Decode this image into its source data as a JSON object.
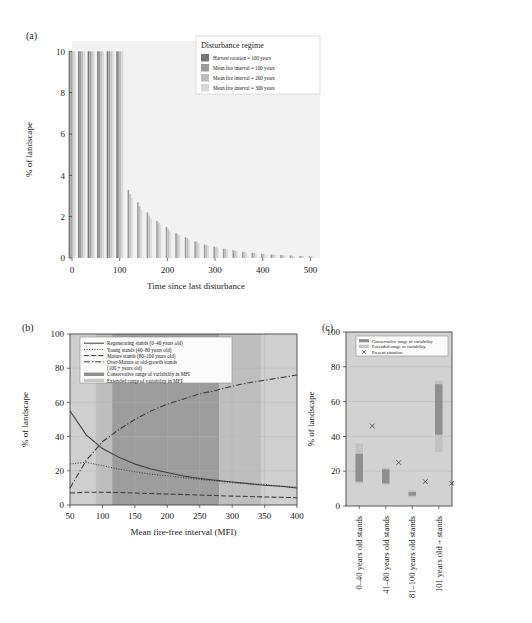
{
  "figure": {
    "panel_a_tag": "(a)",
    "panel_b_tag": "(b)",
    "panel_c_tag": "(c)"
  },
  "panel_a": {
    "ylabel": "% of landscape",
    "xlabel": "Time since last disturbance",
    "legend_title": "Disturbance regime",
    "legend": [
      {
        "label": "Harvest rotation = 100 years",
        "color": "#767676"
      },
      {
        "label": "Mean fire interval = 100 years",
        "color": "#9a9a9a"
      },
      {
        "label": "Mean fire interval = 200 years",
        "color": "#bdbdbd"
      },
      {
        "label": "Mean fire interval = 300 years",
        "color": "#d8d8d8"
      }
    ],
    "xticks": [
      "0",
      "100",
      "200",
      "300",
      "400",
      "500"
    ],
    "yticks": [
      "0",
      "2",
      "4",
      "6",
      "8",
      "10"
    ]
  },
  "panel_b": {
    "ylabel": "% of landscape",
    "xlabel": "Mean fire-free interval (MFI)",
    "xticks": [
      "50",
      "100",
      "150",
      "200",
      "250",
      "300",
      "350",
      "400"
    ],
    "yticks": [
      "0",
      "20",
      "40",
      "60",
      "80",
      "100"
    ],
    "legend": [
      {
        "label": "Regenerating stands (0–40 years old)",
        "style": "solid"
      },
      {
        "label": "Young stands (40–80 years old)",
        "style": "dotted"
      },
      {
        "label": "Mature stands (80–100 years old)",
        "style": "dashed"
      },
      {
        "label": "Over-Mature or old-growth stands",
        "style": "dashdot"
      },
      {
        "label": "(100 + years old)",
        "style": "none"
      },
      {
        "label": "Conservative range of variability in MFI",
        "style": "swatch-dark"
      },
      {
        "label": "Extended range of variability in MFI",
        "style": "swatch-light"
      }
    ]
  },
  "panel_c": {
    "ylabel": "% of landscape",
    "yticks": [
      "0",
      "20",
      "40",
      "60",
      "80",
      "100"
    ],
    "legend": [
      {
        "label": "Conservative range of variability",
        "style": "swatch-dark"
      },
      {
        "label": "Extended range of variability",
        "style": "swatch-light"
      },
      {
        "label": "Present situation",
        "style": "cross"
      }
    ],
    "categories": [
      "0–40 years old stands",
      "41–80 years old stands",
      "81–100 years old stands",
      "101 years old + stands"
    ]
  },
  "chart_data": [
    {
      "type": "bar",
      "panel": "(a)",
      "title": "",
      "xlabel": "Time since last disturbance",
      "ylabel": "% of landscape",
      "xlim": [
        0,
        520
      ],
      "ylim": [
        0,
        10.5
      ],
      "grid": false,
      "legend_title": "Disturbance regime",
      "legend_position": "upper-right-inside",
      "x": [
        0,
        20,
        40,
        60,
        80,
        100,
        120,
        140,
        160,
        180,
        200,
        220,
        240,
        260,
        280,
        300,
        320,
        340,
        360,
        380,
        400,
        420,
        440,
        460,
        480,
        500
      ],
      "series": [
        {
          "name": "Harvest rotation = 100 years",
          "color": "#767676",
          "values": [
            10,
            10,
            10,
            10,
            10,
            10,
            0,
            0,
            0,
            0,
            0,
            0,
            0,
            0,
            0,
            0,
            0,
            0,
            0,
            0,
            0,
            0,
            0,
            0,
            0,
            0
          ]
        },
        {
          "name": "Mean fire interval = 100 years",
          "color": "#9a9a9a",
          "values": [
            10,
            10,
            10,
            10,
            10,
            10,
            3.3,
            2.7,
            2.2,
            1.8,
            1.5,
            1.2,
            1.0,
            0.8,
            0.65,
            0.55,
            0.45,
            0.38,
            0.3,
            0.25,
            0.2,
            0.17,
            0.14,
            0.12,
            0.1,
            0.08
          ]
        },
        {
          "name": "Mean fire interval = 200 years",
          "color": "#bdbdbd",
          "values": [
            10,
            10,
            10,
            10,
            10,
            10,
            3.1,
            2.5,
            2.05,
            1.7,
            1.4,
            1.15,
            0.95,
            0.78,
            0.62,
            0.52,
            0.43,
            0.35,
            0.29,
            0.24,
            0.2,
            0.16,
            0.13,
            0.11,
            0.09,
            0.07
          ]
        },
        {
          "name": "Mean fire interval = 300 years",
          "color": "#d8d8d8",
          "values": [
            10,
            10,
            10,
            10,
            10,
            10,
            2.9,
            2.35,
            1.9,
            1.6,
            1.3,
            1.08,
            0.88,
            0.72,
            0.58,
            0.48,
            0.4,
            0.33,
            0.27,
            0.22,
            0.18,
            0.15,
            0.12,
            0.1,
            0.08,
            0.06
          ]
        }
      ]
    },
    {
      "type": "line",
      "panel": "(b)",
      "title": "",
      "xlabel": "Mean fire-free interval (MFI)",
      "ylabel": "% of landscape",
      "xlim": [
        50,
        400
      ],
      "ylim": [
        0,
        100
      ],
      "grid": true,
      "legend_position": "upper-left-inside",
      "x": [
        50,
        75,
        100,
        125,
        150,
        175,
        200,
        225,
        250,
        275,
        300,
        325,
        350,
        375,
        400
      ],
      "series": [
        {
          "name": "Regenerating stands (0–40 years old)",
          "style": "solid",
          "values": [
            55,
            41,
            33,
            28,
            24,
            21,
            19,
            17,
            15.5,
            14.5,
            13.5,
            12.5,
            11.5,
            11,
            10
          ]
        },
        {
          "name": "Young stands (40–80 years old)",
          "style": "dotted",
          "values": [
            24,
            25,
            23,
            21,
            19.5,
            18,
            17,
            16,
            15,
            14,
            13,
            12.5,
            12,
            11,
            10.5
          ]
        },
        {
          "name": "Mature stands (80–100 years old)",
          "style": "dashed",
          "values": [
            7,
            7.5,
            7.5,
            7.3,
            7,
            6.7,
            6.4,
            6.1,
            5.8,
            5.5,
            5.2,
            5,
            4.7,
            4.5,
            4.3
          ]
        },
        {
          "name": "Over-Mature or old-growth stands (100 + years old)",
          "style": "dashdot",
          "values": [
            10,
            26,
            37,
            44,
            50,
            55,
            59,
            62,
            65,
            67,
            69.5,
            71.5,
            73,
            74.5,
            76
          ]
        }
      ],
      "bands": [
        {
          "name": "Extended range of variability in MFI",
          "from": 50,
          "to": 90,
          "color": "#cfcfcf"
        },
        {
          "name": "Extended range of variability in MFI",
          "from": 90,
          "to": 115,
          "color": "#bebebe"
        },
        {
          "name": "Conservative range of variability in MFI",
          "from": 115,
          "to": 280,
          "color": "#9d9d9d"
        },
        {
          "name": "Extended range of variability in MFI",
          "from": 280,
          "to": 345,
          "color": "#bebebe"
        },
        {
          "name": "Extended range of variability in MFI",
          "from": 345,
          "to": 400,
          "color": "#cfcfcf"
        }
      ]
    },
    {
      "type": "bar",
      "panel": "(c)",
      "title": "",
      "xlabel": "",
      "ylabel": "% of landscape",
      "ylim": [
        0,
        100
      ],
      "grid": true,
      "legend_position": "upper-right-inside",
      "categories": [
        "0–40 years old stands",
        "41–80 years old stands",
        "81–100 years old stands",
        "101 years old + stands"
      ],
      "series": [
        {
          "name": "Extended range of variability",
          "type": "range",
          "color": "#c2c2c2",
          "low": [
            13,
            12,
            5,
            31
          ],
          "high": [
            36,
            22,
            9,
            72
          ]
        },
        {
          "name": "Conservative range of variability",
          "type": "range",
          "color": "#8f8f8f",
          "low": [
            14,
            13,
            6,
            41
          ],
          "high": [
            30,
            21,
            8,
            70
          ]
        },
        {
          "name": "Present situation",
          "type": "marker",
          "marker": "x",
          "values": [
            46,
            25,
            14,
            13
          ]
        }
      ]
    }
  ]
}
